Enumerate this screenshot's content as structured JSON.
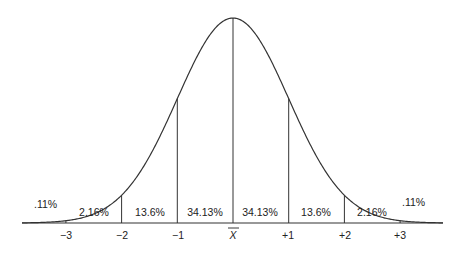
{
  "chart_data": {
    "type": "area",
    "xlabel": "",
    "ylabel": "",
    "x_ticks": [
      "−3",
      "−2",
      "−1",
      "X̄",
      "+1",
      "+2",
      "+3"
    ],
    "regions": [
      {
        "range": "< −3",
        "percent": ".11%"
      },
      {
        "range": "−3 to −2",
        "percent": "2.16%"
      },
      {
        "range": "−2 to −1",
        "percent": "13.6%"
      },
      {
        "range": "−1 to X̄",
        "percent": "34.13%"
      },
      {
        "range": "X̄ to +1",
        "percent": "34.13%"
      },
      {
        "range": "+1 to +2",
        "percent": "13.6%"
      },
      {
        "range": "+2 to +3",
        "percent": "2.16%"
      },
      {
        "range": "> +3",
        "percent": ".11%"
      }
    ],
    "values": [
      0.11,
      2.16,
      13.6,
      34.13,
      34.13,
      13.6,
      2.16,
      0.11
    ],
    "grid": false,
    "legend": "none"
  }
}
